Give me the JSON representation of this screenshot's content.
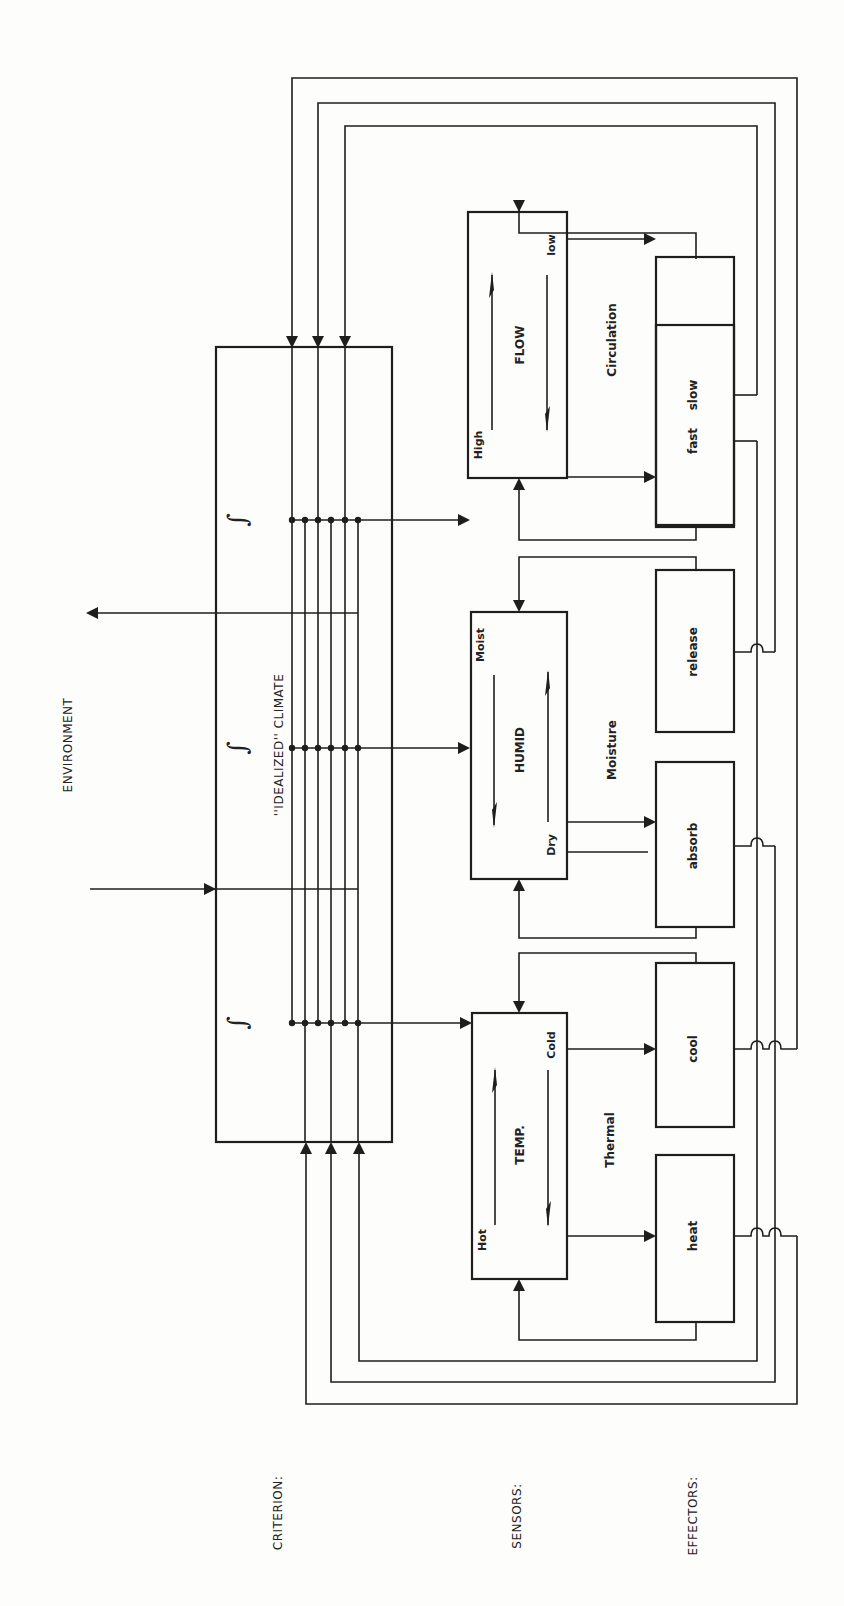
{
  "environment": {
    "label": "ENVIRONMENT"
  },
  "criterion": {
    "row_label": "CRITERION:",
    "box_label": "''IDEALIZED'' CLIMATE",
    "integrator_symbol": "∫"
  },
  "sensors": {
    "row_label": "SENSORS:",
    "items": [
      {
        "name": "TEMP.",
        "top_label": "Cold",
        "bottom_label": "Hot",
        "category": "Thermal"
      },
      {
        "name": "HUMID",
        "top_label": "Moist",
        "bottom_label": "Dry",
        "category": "Moisture"
      },
      {
        "name": "FLOW",
        "top_label": "low",
        "bottom_label": "High",
        "category": "Circulation"
      }
    ]
  },
  "effectors": {
    "row_label": "EFFECTORS:",
    "items": [
      "heat",
      "cool",
      "absorb",
      "release",
      "fast",
      "slow"
    ]
  }
}
